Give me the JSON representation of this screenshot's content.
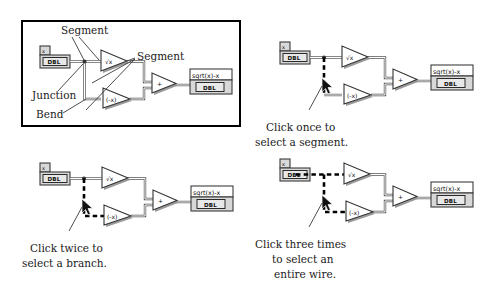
{
  "figure": {
    "background_color": "#ffffff",
    "ink_color": "#111111",
    "selection_color": "#000000",
    "wire_color": "#4a4a4a"
  },
  "common": {
    "input_terminal": {
      "label": "x",
      "datatype": "DBL"
    },
    "output_terminal": {
      "label": "sqrt(x)-x",
      "datatype": "DBL"
    },
    "nodes": [
      {
        "name": "square-root-node",
        "glyph": "√x"
      },
      {
        "name": "negate-node",
        "glyph": "(-x)"
      },
      {
        "name": "add-node",
        "glyph": "+"
      }
    ]
  },
  "panels": {
    "definitions": {
      "name": "wire-anatomy-panel",
      "annotations": [
        {
          "id": "segment-top",
          "label": "Segment"
        },
        {
          "id": "segment-right",
          "label": "Segment"
        },
        {
          "id": "junction",
          "label": "Junction"
        },
        {
          "id": "bend",
          "label": "Bend"
        }
      ]
    },
    "segment": {
      "name": "select-segment-panel",
      "caption_lines": [
        "Click once to",
        "select a segment."
      ],
      "caption": "Click once to select a segment.",
      "selection": "segment",
      "clicks": 1
    },
    "branch": {
      "name": "select-branch-panel",
      "caption_lines": [
        "Click twice to",
        "select a branch."
      ],
      "caption": "Click twice to select a branch.",
      "selection": "branch",
      "clicks": 2
    },
    "wire": {
      "name": "select-entire-wire-panel",
      "caption_lines": [
        "Click three times",
        "to select an",
        "entire wire."
      ],
      "caption": "Click three times to select an entire wire.",
      "selection": "entire wire",
      "clicks": 3
    }
  }
}
